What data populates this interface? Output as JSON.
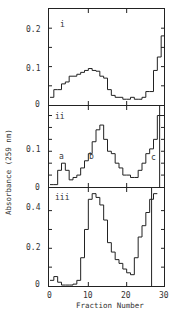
{
  "chart_data": [
    {
      "type": "line",
      "panel": "i",
      "xlabel": "Fraction Number",
      "ylabel": "Absorbance (259 nm)",
      "xlim": [
        0,
        30
      ],
      "ylim": [
        0,
        0.25
      ],
      "yticks": [
        "0",
        "0.1",
        "0.2"
      ],
      "x": [
        0,
        1,
        2,
        3,
        4,
        5,
        6,
        7,
        8,
        9,
        10,
        11,
        12,
        13,
        14,
        15,
        16,
        17,
        18,
        19,
        20,
        21,
        22,
        23,
        24,
        25,
        26,
        27,
        28,
        29
      ],
      "values": [
        0.02,
        0.04,
        0.04,
        0.055,
        0.06,
        0.075,
        0.075,
        0.08,
        0.085,
        0.09,
        0.095,
        0.09,
        0.088,
        0.075,
        0.07,
        0.04,
        0.025,
        0.02,
        0.02,
        0.015,
        0.015,
        0.02,
        0.015,
        0.015,
        0.02,
        0.035,
        0.035,
        0.09,
        0.125,
        0.18
      ],
      "annotations": [
        "i"
      ]
    },
    {
      "type": "line",
      "panel": "ii",
      "xlabel": "Fraction Number",
      "ylabel": "Absorbance (259 nm)",
      "xlim": [
        0,
        30
      ],
      "ylim": [
        0,
        0.17
      ],
      "yticks": [
        "0",
        "0.1"
      ],
      "x": [
        0,
        1,
        2,
        3,
        4,
        5,
        6,
        7,
        8,
        9,
        10,
        11,
        12,
        13,
        14,
        15,
        16,
        17,
        18,
        19,
        20,
        21,
        22,
        23,
        24,
        25,
        26,
        27,
        28
      ],
      "values": [
        0.005,
        0.005,
        0.035,
        0.05,
        0.035,
        0.015,
        0.02,
        0.025,
        0.04,
        0.055,
        0.07,
        0.095,
        0.12,
        0.13,
        0.1,
        0.075,
        0.07,
        0.05,
        0.04,
        0.025,
        0.025,
        0.02,
        0.02,
        0.035,
        0.05,
        0.07,
        0.08,
        0.1,
        0.15
      ],
      "annotations": [
        "ii",
        "a",
        "b",
        "c"
      ]
    },
    {
      "type": "line",
      "panel": "iii",
      "xlabel": "Fraction Number",
      "ylabel": "Absorbance (259 nm)",
      "xlim": [
        0,
        30
      ],
      "ylim": [
        0,
        0.5
      ],
      "yticks": [
        "0",
        "0.2",
        "0.4"
      ],
      "xticks": [
        "0",
        "10",
        "20",
        "30"
      ],
      "x": [
        0,
        1,
        2,
        3,
        4,
        5,
        6,
        7,
        8,
        9,
        10,
        11,
        12,
        13,
        14,
        15,
        16,
        17,
        18,
        19,
        20,
        21,
        22,
        23,
        24,
        25,
        26
      ],
      "values": [
        0.03,
        0.05,
        0.02,
        0.005,
        0.005,
        0.005,
        0.01,
        0.03,
        0.15,
        0.3,
        0.46,
        0.49,
        0.47,
        0.43,
        0.35,
        0.23,
        0.18,
        0.14,
        0.12,
        0.09,
        0.07,
        0.06,
        0.15,
        0.26,
        0.32,
        0.39,
        0.46,
        0.49
      ],
      "annotations": [
        "iii"
      ]
    }
  ],
  "labels": {
    "xlabel": "Fraction Number",
    "ylabel": "Absorbance (259 nm)",
    "panel_i": "i",
    "panel_ii": "ii",
    "panel_iii": "iii",
    "peak_a": "a",
    "peak_b": "b",
    "peak_c": "c",
    "xticks": [
      "0",
      "10",
      "20",
      "30"
    ],
    "yticks_i": [
      "0",
      "0.1",
      "0.2"
    ],
    "yticks_ii": [
      "0",
      "0.1"
    ],
    "yticks_iii": [
      "0",
      "0.2",
      "0.4"
    ]
  }
}
